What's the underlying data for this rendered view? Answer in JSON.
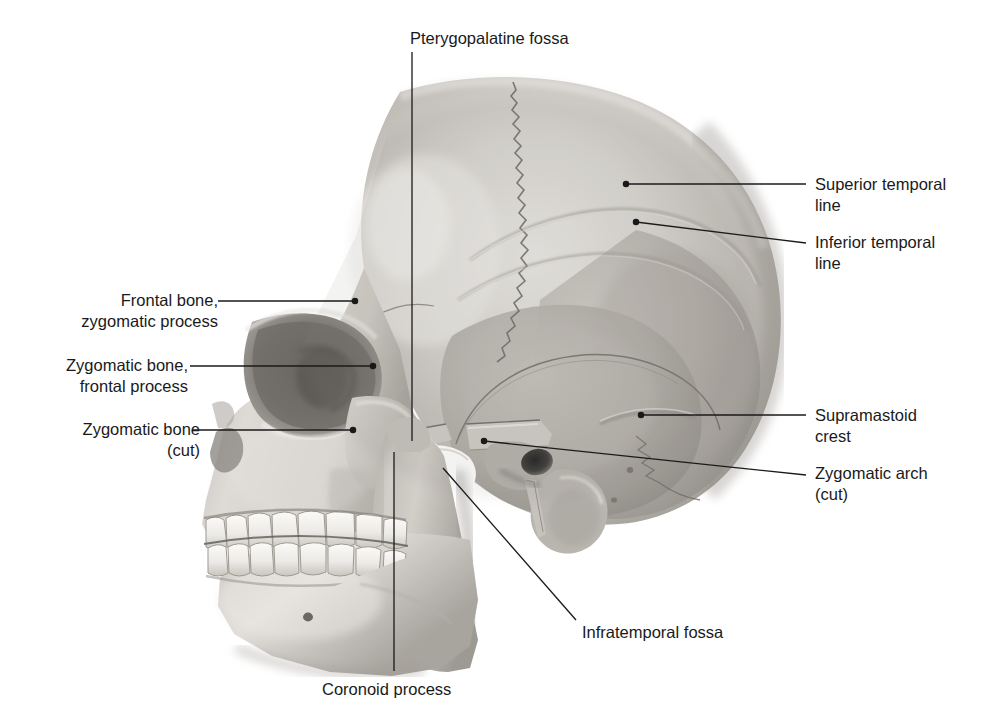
{
  "figure": {
    "view": "left lateral view of skull with zygomatic arch cut",
    "background_color": "#ffffff",
    "leader_color": "#1a1a1a",
    "text_color": "#1a1a1a"
  },
  "labels": [
    {
      "id": "pterygopalatine-fossa",
      "text": "Pterygopalatine fossa",
      "side": "top",
      "align": "center",
      "text_x": 410,
      "text_y": 28,
      "leader": {
        "type": "vertical",
        "x": 412,
        "y1": 52,
        "y2": 441,
        "dot": false
      }
    },
    {
      "id": "superior-temporal-line",
      "text": "Superior temporal\nline",
      "side": "right",
      "align": "left",
      "text_x": 815,
      "text_y": 174,
      "leader": {
        "type": "line",
        "x1": 626,
        "y1": 184,
        "x2": 806,
        "y2": 184,
        "dot": true
      }
    },
    {
      "id": "inferior-temporal-line",
      "text": "Inferior temporal\nline",
      "side": "right",
      "align": "left",
      "text_x": 815,
      "text_y": 232,
      "leader": {
        "type": "line",
        "x1": 636,
        "y1": 222,
        "x2": 806,
        "y2": 243,
        "dot": true
      }
    },
    {
      "id": "frontal-bone-zygomatic-process",
      "text": "Frontal bone,\nzygomatic process",
      "side": "left",
      "align": "right",
      "text_x": 68,
      "text_y": 290,
      "leader": {
        "type": "line",
        "x1": 355,
        "y1": 301,
        "x2": 218,
        "y2": 301,
        "dot": true
      }
    },
    {
      "id": "zygomatic-bone-frontal-process",
      "text": "Zygomatic bone,\nfrontal process",
      "side": "left",
      "align": "right",
      "text_x": 38,
      "text_y": 355,
      "leader": {
        "type": "line",
        "x1": 373,
        "y1": 366,
        "x2": 190,
        "y2": 366,
        "dot": true
      }
    },
    {
      "id": "zygomatic-bone-cut",
      "text": "Zygomatic bone\n(cut)",
      "side": "left",
      "align": "right",
      "text_x": 50,
      "text_y": 419,
      "leader": {
        "type": "line",
        "x1": 353,
        "y1": 430,
        "x2": 192,
        "y2": 430,
        "dot": true
      }
    },
    {
      "id": "supramastoid-crest",
      "text": "Supramastoid\ncrest",
      "side": "right",
      "align": "left",
      "text_x": 815,
      "text_y": 405,
      "leader": {
        "type": "line",
        "x1": 641,
        "y1": 415,
        "x2": 806,
        "y2": 415,
        "dot": true
      }
    },
    {
      "id": "zygomatic-arch-cut",
      "text": "Zygomatic arch\n(cut)",
      "side": "right",
      "align": "left",
      "text_x": 815,
      "text_y": 463,
      "leader": {
        "type": "line",
        "x1": 484,
        "y1": 441,
        "x2": 806,
        "y2": 475,
        "dot": true
      }
    },
    {
      "id": "infratemporal-fossa",
      "text": "Infratemporal fossa",
      "side": "bottom-right",
      "align": "left",
      "text_x": 582,
      "text_y": 622,
      "leader": {
        "type": "line",
        "x1": 443,
        "y1": 468,
        "x2": 576,
        "y2": 620,
        "dot": false
      }
    },
    {
      "id": "coronoid-process",
      "text": "Coronoid process",
      "side": "bottom",
      "align": "center",
      "text_x": 322,
      "text_y": 679,
      "leader": {
        "type": "vertical",
        "x": 394,
        "y1": 452,
        "y2": 671,
        "dot": false
      }
    }
  ]
}
